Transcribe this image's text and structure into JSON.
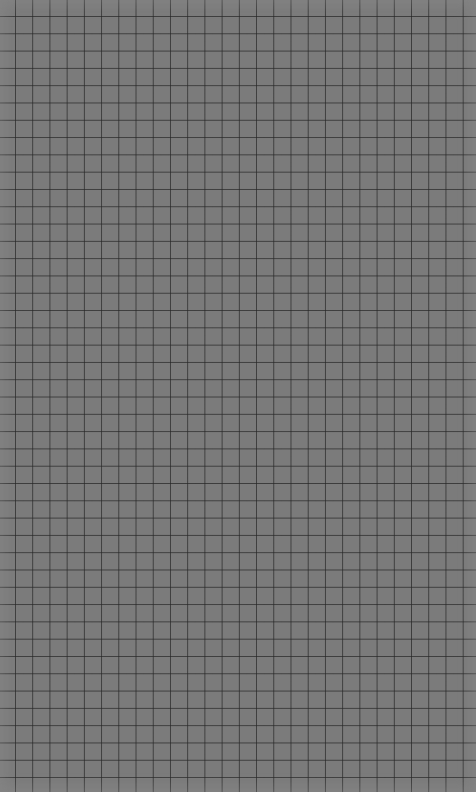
{
  "sheet": {
    "type": "grid-paper",
    "background_color": "#7b7b7b",
    "line_color": "#2e2e2e",
    "cell_width_px": 17.23,
    "cell_height_px": 17.3,
    "vertical_lines": 27,
    "horizontal_lines": 45,
    "label": ""
  }
}
